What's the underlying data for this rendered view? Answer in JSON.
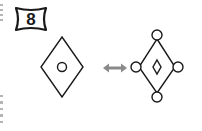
{
  "puzzle": {
    "number": "8",
    "left_figure": {
      "shape": "diamond",
      "inner": "circle"
    },
    "relation": {
      "icon": "double-arrow-icon",
      "color": "#888888"
    },
    "right_figure": {
      "shape": "diamond",
      "inner": "small-diamond",
      "vertex_markers": "circles"
    }
  },
  "colors": {
    "stroke": "#1a1a1a",
    "background": "#ffffff",
    "arrow": "#8a8a8a"
  }
}
